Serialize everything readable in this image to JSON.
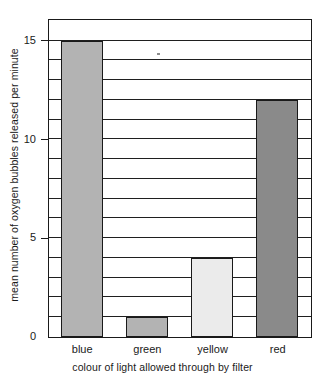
{
  "chart_data": {
    "type": "bar",
    "title": "",
    "subtitle": "",
    "xlabel": "colour of light allowed through by filter",
    "ylabel": "mean number of oxygen bubbles released per minute",
    "categories": [
      "blue",
      "green",
      "yellow",
      "red"
    ],
    "values": [
      15,
      1,
      4,
      12
    ],
    "series": [
      {
        "name": "mean number of oxygen bubbles released per minute",
        "values": [
          15,
          1,
          4,
          12
        ]
      }
    ],
    "bar_colors": [
      "#b3b3b3",
      "#b3b3b3",
      "#ebebeb",
      "#8a8a8a"
    ],
    "bar_outline_color": "#1a1a1a",
    "ylim": [
      0,
      16
    ],
    "xlim": [
      0,
      4
    ],
    "ytick_labels": [
      "0",
      "5",
      "10",
      "15"
    ],
    "ytick_values": [
      0,
      5,
      10,
      15
    ],
    "gridline_interval": 1,
    "grid": true,
    "grid_orientation": "horizontal",
    "grid_color": "#1f1f1f",
    "legend": null,
    "legend_position": "none",
    "annotations": [],
    "axis_color": "#1a1a1a",
    "background_color": "#ffffff"
  },
  "axes": {
    "y_title": "mean number of oxygen bubbles released per minute",
    "x_title": "colour of light allowed through by filter"
  },
  "ticks": {
    "y": [
      {
        "label": "15",
        "value": 15
      },
      {
        "label": "10",
        "value": 10
      },
      {
        "label": "5",
        "value": 5
      },
      {
        "label": "0",
        "value": 0
      }
    ],
    "x": [
      {
        "label": "blue",
        "value": 15
      },
      {
        "label": "green",
        "value": 1
      },
      {
        "label": "yellow",
        "value": 4
      },
      {
        "label": "red",
        "value": 12
      }
    ]
  }
}
